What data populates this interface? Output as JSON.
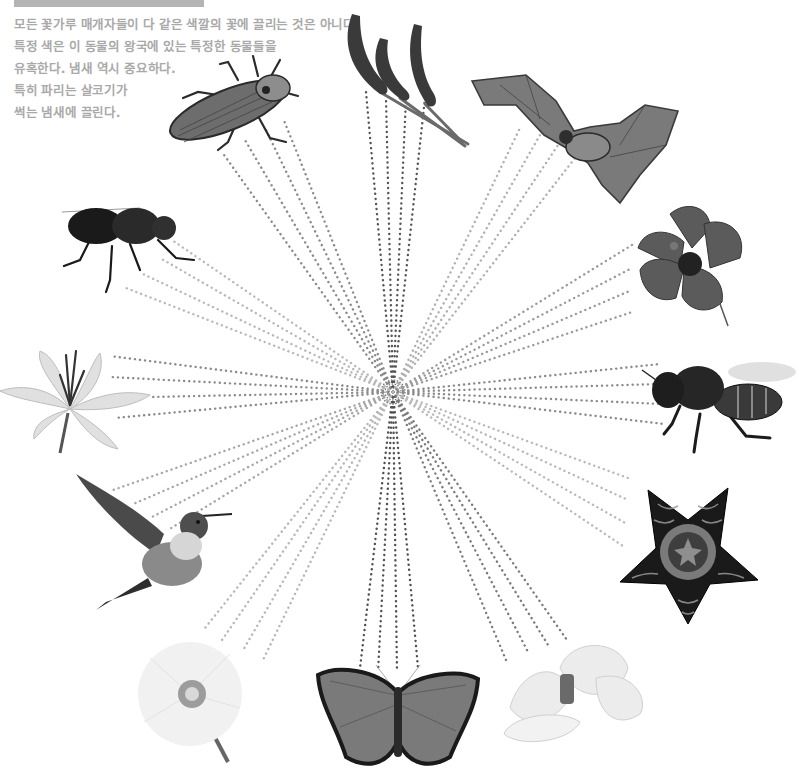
{
  "header_bar": {
    "color": "#b4b4b4"
  },
  "caption": {
    "lines": [
      "모든 꽃가루 매개자들이 다 같은 색깔의 꽃에 끌리는 것은 아니다.",
      "특정 색은 이 동물의 왕국에 있는 특정한 동물들을",
      "유혹한다. 냄새 역시 중요하다.",
      "특히 파리는 살코기가",
      "썩는 냄새에 끌린다."
    ],
    "color": "#a9a9a9"
  },
  "diagram": {
    "center": {
      "x": 393,
      "y": 392
    },
    "ring_count": 3,
    "nodes": [
      {
        "id": "beetle",
        "label": "beetle",
        "kind": "pollinator",
        "tone": "#5a5a5a"
      },
      {
        "id": "grass",
        "label": "grass-flower",
        "kind": "flower",
        "tone": "#3e3e3e"
      },
      {
        "id": "bat",
        "label": "bat",
        "kind": "pollinator",
        "tone": "#6a6a6a"
      },
      {
        "id": "hibiscus",
        "label": "hibiscus",
        "kind": "flower",
        "tone": "#555555"
      },
      {
        "id": "bee",
        "label": "bee",
        "kind": "pollinator",
        "tone": "#2a2a2a"
      },
      {
        "id": "stapelia",
        "label": "stapelia-starfish-flower",
        "kind": "flower",
        "tone": "#1e1e1e"
      },
      {
        "id": "magnolia",
        "label": "magnolia",
        "kind": "flower",
        "tone": "#dcdcdc"
      },
      {
        "id": "butterfly",
        "label": "butterfly",
        "kind": "pollinator",
        "tone": "#6e6e6e"
      },
      {
        "id": "poppy",
        "label": "white-poppy",
        "kind": "flower",
        "tone": "#e8e8e8"
      },
      {
        "id": "hummingbird",
        "label": "hummingbird",
        "kind": "pollinator",
        "tone": "#4e4e4e"
      },
      {
        "id": "lily",
        "label": "lily",
        "kind": "flower",
        "tone": "#c8c8c8"
      },
      {
        "id": "fly",
        "label": "fly",
        "kind": "pollinator",
        "tone": "#1c1c1c"
      }
    ],
    "rays": [
      {
        "to": "beetle",
        "ends": [
          [
            222,
            152
          ],
          [
            245,
            140
          ],
          [
            265,
            128
          ],
          [
            283,
            118
          ]
        ],
        "color": "#8a8a8a"
      },
      {
        "to": "grass",
        "ends": [
          [
            366,
            92
          ],
          [
            386,
            98
          ],
          [
            406,
            98
          ],
          [
            425,
            98
          ]
        ],
        "color": "#555555"
      },
      {
        "to": "bat",
        "ends": [
          [
            520,
            128
          ],
          [
            540,
            135
          ],
          [
            558,
            145
          ],
          [
            575,
            158
          ]
        ],
        "color": "#b0b0b0"
      },
      {
        "to": "hibiscus",
        "ends": [
          [
            632,
            245
          ],
          [
            632,
            268
          ],
          [
            632,
            290
          ],
          [
            632,
            312
          ]
        ],
        "color": "#9a9a9a"
      },
      {
        "to": "bee",
        "ends": [
          [
            660,
            364
          ],
          [
            660,
            384
          ],
          [
            662,
            404
          ],
          [
            664,
            424
          ]
        ],
        "color": "#8a8a8a"
      },
      {
        "to": "stapelia",
        "ends": [
          [
            628,
            478
          ],
          [
            628,
            500
          ],
          [
            627,
            524
          ],
          [
            626,
            548
          ]
        ],
        "color": "#b8b8b8"
      },
      {
        "to": "magnolia",
        "ends": [
          [
            506,
            660
          ],
          [
            528,
            652
          ],
          [
            548,
            645
          ],
          [
            567,
            640
          ]
        ],
        "color": "#7a7a7a"
      },
      {
        "to": "butterfly",
        "ends": [
          [
            360,
            668
          ],
          [
            378,
            672
          ],
          [
            397,
            672
          ],
          [
            418,
            668
          ]
        ],
        "color": "#505050"
      },
      {
        "to": "poppy",
        "ends": [
          [
            205,
            628
          ],
          [
            222,
            640
          ],
          [
            242,
            652
          ],
          [
            262,
            662
          ]
        ],
        "color": "#b6b6b6"
      },
      {
        "to": "hummingbird",
        "ends": [
          [
            113,
            490
          ],
          [
            131,
            505
          ],
          [
            150,
            518
          ],
          [
            168,
            530
          ]
        ],
        "color": "#a6a6a6"
      },
      {
        "to": "lily",
        "ends": [
          [
            110,
            356
          ],
          [
            110,
            377
          ],
          [
            150,
            397
          ],
          [
            115,
            418
          ]
        ],
        "color": "#8a8a8a"
      },
      {
        "to": "fly",
        "ends": [
          [
            172,
            240
          ],
          [
            160,
            258
          ],
          [
            143,
            274
          ],
          [
            126,
            288
          ]
        ],
        "color": "#b8b8b8"
      }
    ]
  }
}
